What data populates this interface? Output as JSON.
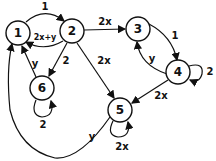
{
  "diagram": {
    "type": "directed-graph",
    "nodes": [
      {
        "id": "1",
        "label": "1"
      },
      {
        "id": "2",
        "label": "2"
      },
      {
        "id": "3",
        "label": "3"
      },
      {
        "id": "4",
        "label": "4"
      },
      {
        "id": "5",
        "label": "5"
      },
      {
        "id": "6",
        "label": "6"
      }
    ],
    "edges": [
      {
        "from": "1",
        "to": "2",
        "label": "1"
      },
      {
        "from": "2",
        "to": "1",
        "label": "2x+y"
      },
      {
        "from": "2",
        "to": "3",
        "label": "2x"
      },
      {
        "from": "2",
        "to": "6",
        "label": "2"
      },
      {
        "from": "2",
        "to": "5",
        "label": "2x"
      },
      {
        "from": "3",
        "to": "4",
        "label": "1"
      },
      {
        "from": "4",
        "to": "3",
        "label": "y"
      },
      {
        "from": "4",
        "to": "4",
        "label": "2"
      },
      {
        "from": "4",
        "to": "5",
        "label": "2x"
      },
      {
        "from": "5",
        "to": "5",
        "label": "2x"
      },
      {
        "from": "5",
        "to": "1",
        "label": "y"
      },
      {
        "from": "6",
        "to": "1",
        "label": "y"
      },
      {
        "from": "6",
        "to": "6",
        "label": "2"
      }
    ]
  }
}
